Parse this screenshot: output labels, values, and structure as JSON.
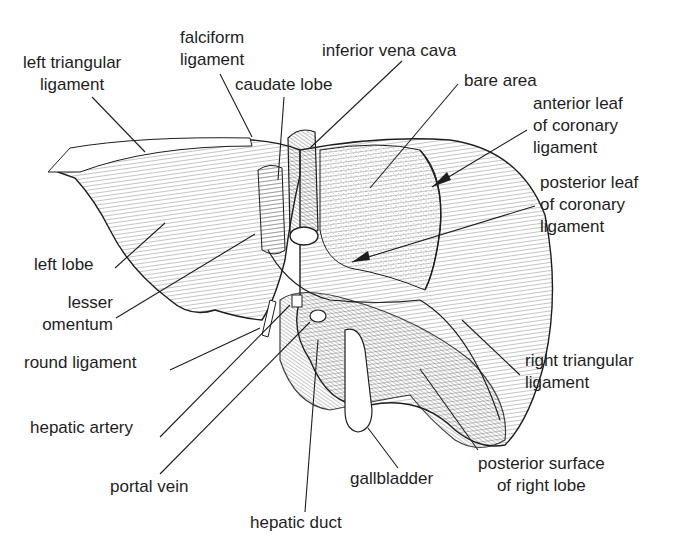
{
  "figure": {
    "colors": {
      "ink": "#1e1e1e",
      "paper": "#ffffff",
      "shade": "#d9d9d9"
    }
  },
  "labels": {
    "left_triangular_ligament": [
      "left triangular",
      "ligament"
    ],
    "falciform_ligament": [
      "falciform",
      "ligament"
    ],
    "inferior_vena_cava": "inferior vena cava",
    "caudate_lobe": "caudate lobe",
    "bare_area": "bare area",
    "anterior_leaf": [
      "anterior leaf",
      "of coronary",
      "ligament"
    ],
    "posterior_leaf": [
      "posterior leaf",
      "of coronary",
      "ligament"
    ],
    "left_lobe": "left lobe",
    "lesser_omentum": [
      "lesser",
      "omentum"
    ],
    "round_ligament": "round ligament",
    "right_triangular_ligament": [
      "right triangular",
      "ligament"
    ],
    "hepatic_artery": "hepatic artery",
    "portal_vein": "portal vein",
    "gallbladder": "gallbladder",
    "posterior_surface": [
      "posterior surface",
      "of right lobe"
    ],
    "hepatic_duct": "hepatic duct"
  }
}
